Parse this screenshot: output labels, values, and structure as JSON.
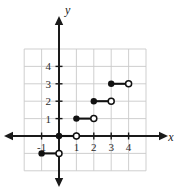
{
  "figure": {
    "kind": "coordinate-plane-step-function",
    "background_color": "#ffffff",
    "axis_color": "#1a1a1a",
    "grid_color": "#c9c9c9",
    "curve_color": "#111111"
  },
  "axes": {
    "x_name": "x",
    "y_name": "y",
    "x_tick_labels": [
      "-1",
      "1",
      "2",
      "3",
      "4"
    ],
    "x_tick_values": [
      -1,
      1,
      2,
      3,
      4
    ],
    "y_tick_labels": [
      "1",
      "2",
      "3",
      "4"
    ],
    "y_tick_values": [
      1,
      2,
      3,
      4
    ],
    "x_arrow_left": "◀",
    "x_arrow_right": "▶",
    "y_arrow_up": "▲",
    "y_arrow_down": "▼"
  },
  "chart_data": {
    "type": "line",
    "title": "",
    "xlabel": "x",
    "ylabel": "y",
    "xlim": [
      -2,
      5
    ],
    "ylim": [
      -2,
      5
    ],
    "grid": true,
    "grid_step": 1,
    "legend": "none",
    "series": [
      {
        "name": "step function",
        "style": "step-segments",
        "segments": [
          {
            "x_start": -1,
            "x_end": 0,
            "y": -1,
            "left_endpoint": "closed",
            "right_endpoint": "open"
          },
          {
            "x_start": 0,
            "x_end": 1,
            "y": 0,
            "left_endpoint": "closed",
            "right_endpoint": "open"
          },
          {
            "x_start": 1,
            "x_end": 2,
            "y": 1,
            "left_endpoint": "closed",
            "right_endpoint": "open"
          },
          {
            "x_start": 2,
            "x_end": 3,
            "y": 2,
            "left_endpoint": "closed",
            "right_endpoint": "open"
          },
          {
            "x_start": 3,
            "x_end": 4,
            "y": 3,
            "left_endpoint": "closed",
            "right_endpoint": "open"
          }
        ]
      }
    ]
  }
}
